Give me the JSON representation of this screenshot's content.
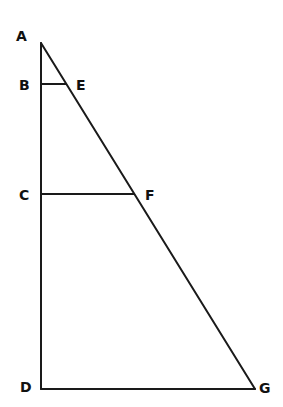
{
  "diagram": {
    "type": "geometry-figure",
    "stroke_color": "#1a1a1a",
    "points": {
      "A": {
        "x": 41,
        "y": 43,
        "label": "A",
        "label_x": 16,
        "label_y": 41
      },
      "B": {
        "x": 41,
        "y": 84,
        "label": "B",
        "label_x": 19,
        "label_y": 90
      },
      "E": {
        "x": 66,
        "y": 84,
        "label": "E",
        "label_x": 76,
        "label_y": 90
      },
      "C": {
        "x": 41,
        "y": 194,
        "label": "C",
        "label_x": 19,
        "label_y": 200
      },
      "F": {
        "x": 134,
        "y": 194,
        "label": "F",
        "label_x": 145,
        "label_y": 200
      },
      "D": {
        "x": 41,
        "y": 389,
        "label": "D",
        "label_x": 20,
        "label_y": 392
      },
      "G": {
        "x": 255,
        "y": 389,
        "label": "G",
        "label_x": 259,
        "label_y": 393
      }
    },
    "segments": [
      {
        "from": "A",
        "to": "D"
      },
      {
        "from": "D",
        "to": "G"
      },
      {
        "from": "A",
        "to": "G"
      },
      {
        "from": "B",
        "to": "E"
      },
      {
        "from": "C",
        "to": "F"
      }
    ]
  }
}
